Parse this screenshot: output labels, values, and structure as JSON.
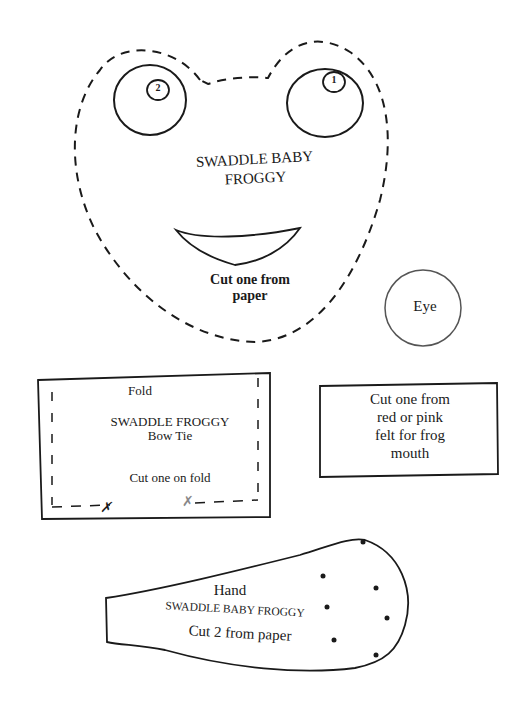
{
  "head_piece": {
    "title_line1": "SWADDLE BABY",
    "title_line2": "FROGGY",
    "cut_line1": "Cut one from",
    "cut_line2": "paper",
    "left_pupil_mark": "2",
    "right_pupil_mark": "1"
  },
  "eye_piece": {
    "label": "Eye"
  },
  "bow_tie_piece": {
    "fold_label": "Fold",
    "title_line1": "SWADDLE FROGGY",
    "title_line2": "Bow Tie",
    "cut_text": "Cut one on fold"
  },
  "mouth_note": {
    "line1": "Cut one from",
    "line2": "red or pink",
    "line3": "felt for frog",
    "line4": "mouth"
  },
  "hand_piece": {
    "label": "Hand",
    "title": "SWADDLE BABY FROGGY",
    "cut_text": "Cut 2 from paper"
  },
  "colors": {
    "ink": "#1a1a1a",
    "paper": "#ffffff"
  }
}
